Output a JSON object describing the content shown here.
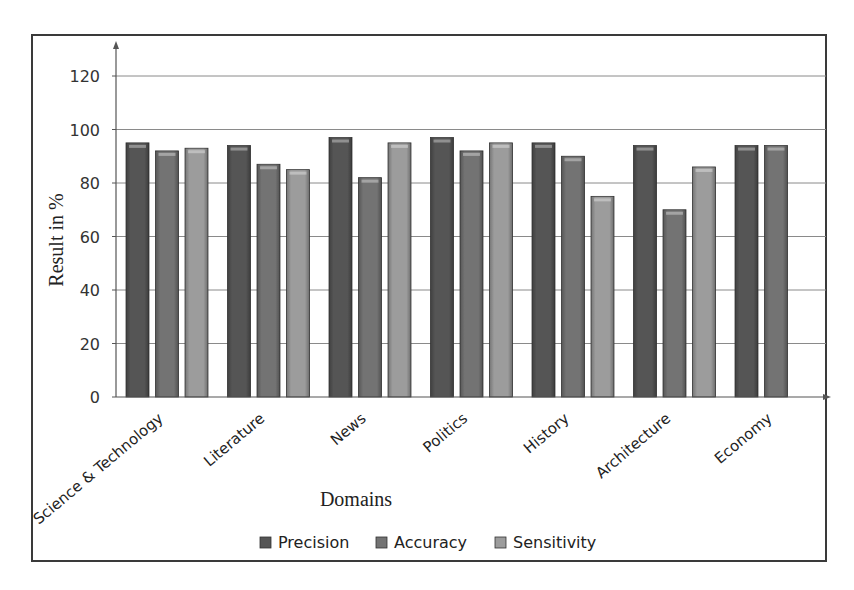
{
  "chart_data": {
    "type": "bar",
    "title": "",
    "xlabel": "Domains",
    "ylabel": "Result in %",
    "ylim": [
      0,
      120
    ],
    "yticks": [
      0,
      20,
      40,
      60,
      80,
      100,
      120
    ],
    "grid": true,
    "legend_position": "bottom",
    "categories": [
      "Science & Technology",
      "Literature",
      "News",
      "Politics",
      "History",
      "Architecture",
      "Economy"
    ],
    "series": [
      {
        "name": "Precision",
        "color": "#555555",
        "values": [
          95,
          94,
          97,
          97,
          95,
          94,
          94
        ]
      },
      {
        "name": "Accuracy",
        "color": "#737373",
        "values": [
          92,
          87,
          82,
          92,
          90,
          70,
          94
        ]
      },
      {
        "name": "Sensitivity",
        "color": "#9c9c9c",
        "values": [
          93,
          85,
          95,
          95,
          75,
          86,
          null
        ]
      }
    ]
  }
}
